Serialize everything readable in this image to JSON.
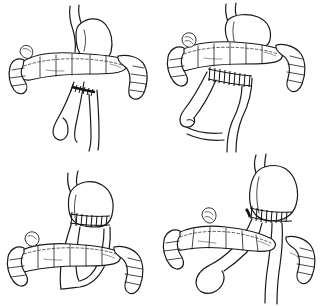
{
  "figure": {
    "title": "",
    "caption": "",
    "background_color": "#ffffff",
    "ink_color": "#1a1a1a",
    "layout": "2x2 grid of line-drawn surgical illustrations",
    "panel_count": 4,
    "panel_width": 160,
    "panel_height": 153,
    "style": "black ink pen-and-ink medical line drawing, no labels, no text"
  },
  "panels": [
    {
      "id": "panel-tl",
      "position": "top-left",
      "label": "",
      "subject": "stomach with transverse colon and small-bowel anastomosis",
      "anatomy": [
        "esophagus",
        "stomach",
        "transverse-colon",
        "ascending-colon",
        "descending-colon",
        "jejunal-loop",
        "anastomosis"
      ],
      "suture_lines": 1,
      "bowel_loops": 2
    },
    {
      "id": "panel-tr",
      "position": "top-right",
      "label": "",
      "subject": "stomach with colon and stapled side-to-side anastomosis to jejunal limbs",
      "anatomy": [
        "esophagus",
        "stomach",
        "transverse-colon",
        "ascending-colon",
        "descending-colon",
        "jejunal-limb",
        "anastomosis"
      ],
      "suture_lines": 1,
      "bowel_loops": 2
    },
    {
      "id": "panel-bl",
      "position": "bottom-left",
      "label": "",
      "subject": "gastric pouch with transected stomach and Roux limb passing behind colon",
      "anatomy": [
        "esophagus",
        "gastric-pouch",
        "staple-line",
        "roux-limb",
        "transverse-colon",
        "cecum",
        "appendix"
      ],
      "suture_lines": 1,
      "bowel_loops": 1
    },
    {
      "id": "panel-br",
      "position": "bottom-right",
      "label": "",
      "subject": "gastric pouch with gastrojejunal anastomosis and long Roux limb over colon",
      "anatomy": [
        "esophagus",
        "gastric-pouch",
        "staple-line",
        "gastrojejunostomy",
        "roux-limb",
        "transverse-colon",
        "cecum",
        "appendix"
      ],
      "suture_lines": 1,
      "bowel_loops": 2
    }
  ],
  "colors": {
    "ink": "#1a1a1a",
    "suture": "#111111",
    "background": "#ffffff"
  }
}
